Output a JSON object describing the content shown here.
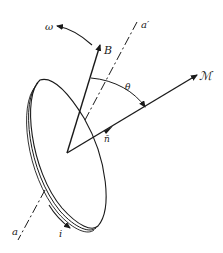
{
  "diagram": {
    "type": "physics-vector-diagram",
    "labels": {
      "omega": "ω",
      "B": "B",
      "a_prime": "a′",
      "theta": "θ",
      "M": "ℳ",
      "n": "n̄",
      "a": "a",
      "i": "i"
    },
    "colors": {
      "stroke": "#1a1a1a",
      "background": "#ffffff"
    }
  }
}
